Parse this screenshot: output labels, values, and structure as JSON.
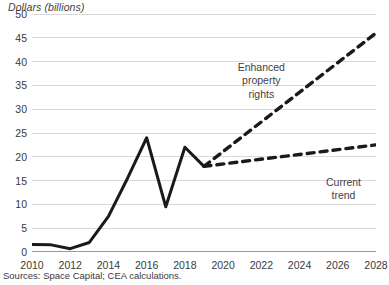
{
  "chart_data": {
    "type": "line",
    "title": "",
    "subtitle": "",
    "ylabel": "Dollars (billions)",
    "xlabel": "",
    "ylim": [
      0,
      50
    ],
    "xlim": [
      2010,
      2028
    ],
    "yticks": [
      0,
      5,
      10,
      15,
      20,
      25,
      30,
      35,
      40,
      45,
      50
    ],
    "xticks": [
      2010,
      2012,
      2014,
      2016,
      2018,
      2020,
      2022,
      2024,
      2026,
      2028
    ],
    "grid": true,
    "legend_position": "none",
    "series": [
      {
        "name": "Historical investment",
        "style": "solid",
        "color": "#1a1a1a",
        "x": [
          2010,
          2011,
          2012,
          2013,
          2014,
          2015,
          2016,
          2017,
          2018,
          2019
        ],
        "values": [
          1.6,
          1.5,
          0.7,
          2.0,
          7.5,
          15.5,
          24.0,
          9.5,
          22.0,
          18.0
        ]
      },
      {
        "name": "Enhanced property rights",
        "style": "dashed",
        "color": "#1a1a1a",
        "x": [
          2019,
          2028
        ],
        "values": [
          18.0,
          46.0
        ]
      },
      {
        "name": "Current trend",
        "style": "dashed",
        "color": "#1a1a1a",
        "x": [
          2019,
          2028
        ],
        "values": [
          18.0,
          22.5
        ]
      }
    ],
    "annotations": [
      {
        "label_line1": "Enhanced",
        "label_line2": "property",
        "label_line3": "rights"
      },
      {
        "label_line1": "Current",
        "label_line2": "trend"
      }
    ],
    "source": "Sources: Space Capital; CEA calculations."
  },
  "labels": {
    "axis_title": "Dollars (billions)",
    "source": "Sources: Space Capital; CEA calculations.",
    "annotation_enhanced_1": "Enhanced",
    "annotation_enhanced_2": "property",
    "annotation_enhanced_3": "rights",
    "annotation_current_1": "Current",
    "annotation_current_2": "trend"
  },
  "ytick_labels": [
    "50",
    "45",
    "40",
    "35",
    "30",
    "25",
    "20",
    "15",
    "10",
    "5",
    "0"
  ],
  "xtick_labels": [
    "2010",
    "2012",
    "2014",
    "2016",
    "2018",
    "2020",
    "2022",
    "2024",
    "2026",
    "2028"
  ],
  "colors": {
    "line": "#1a1a1a",
    "grid": "#d9d9d9",
    "axis": "#9a9a9a",
    "text": "#3a3a3a",
    "background": "#ffffff"
  }
}
